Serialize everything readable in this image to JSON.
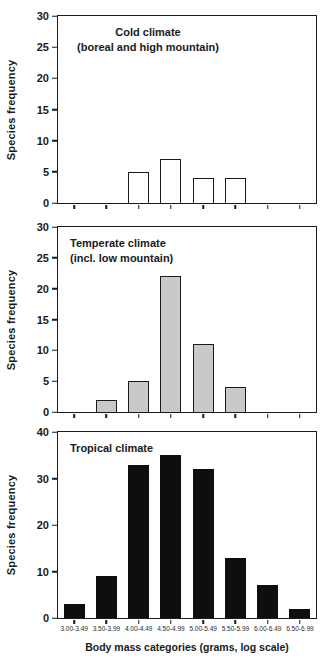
{
  "chart_data": [
    {
      "type": "bar",
      "title_lines": [
        "Cold climate",
        "(boreal and high mountain)"
      ],
      "categories": [
        "3.00-3.49",
        "3.50-3.99",
        "4.00-4.49",
        "4.50-4.99",
        "5.00-5.49",
        "5.50-5.99",
        "6.00-6.49",
        "6.50-6.99"
      ],
      "values": [
        0,
        0,
        5,
        7,
        4,
        4,
        0,
        0
      ],
      "ylabel": "Species frequency",
      "xlabel": "",
      "ylim": [
        0,
        30
      ],
      "ystep": 5,
      "bar_fill": "#ffffff",
      "bar_border": "#1a1a1a",
      "show_x_labels": false,
      "grid": false,
      "legend": false
    },
    {
      "type": "bar",
      "title_lines": [
        "Temperate climate",
        "(incl. low mountain)"
      ],
      "categories": [
        "3.00-3.49",
        "3.50-3.99",
        "4.00-4.49",
        "4.50-4.99",
        "5.00-5.49",
        "5.50-5.99",
        "6.00-6.49",
        "6.50-6.99"
      ],
      "values": [
        0,
        2,
        5,
        22,
        11,
        4,
        0,
        0
      ],
      "ylabel": "Species frequency",
      "xlabel": "",
      "ylim": [
        0,
        30
      ],
      "ystep": 5,
      "bar_fill": "#c9c9c9",
      "bar_border": "#1a1a1a",
      "show_x_labels": false,
      "grid": false,
      "legend": false
    },
    {
      "type": "bar",
      "title_lines": [
        "Tropical climate"
      ],
      "categories": [
        "3.00-3.49",
        "3.50-3.99",
        "4.00-4.49",
        "4.50-4.99",
        "5.00-5.49",
        "5.50-5.99",
        "6.00-6.49",
        "6.50-6.99"
      ],
      "values": [
        3,
        9,
        33,
        35,
        32,
        13,
        7,
        2
      ],
      "ylabel": "Species frequency",
      "xlabel": "Body mass categories (grams, log scale)",
      "ylim": [
        0,
        40
      ],
      "ystep": 10,
      "bar_fill": "#0e0e0e",
      "bar_border": "#0e0e0e",
      "show_x_labels": true,
      "grid": false,
      "legend": false
    }
  ]
}
